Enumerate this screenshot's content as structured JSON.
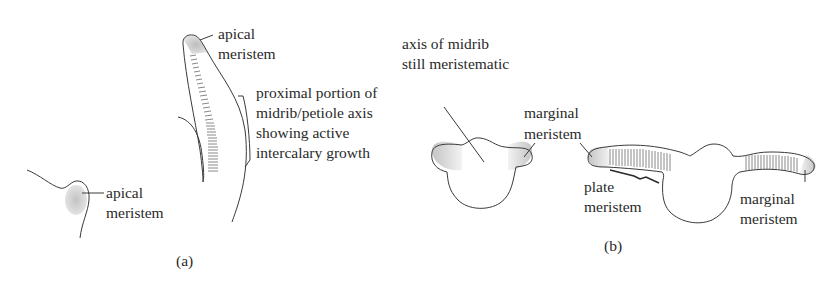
{
  "figure": {
    "panel_a": {
      "caption": "(a)",
      "labels": {
        "apical_meristem_tip": [
          "apical",
          "meristem"
        ],
        "proximal_portion": [
          "proximal portion of",
          "midrib/petiole axis",
          "showing active",
          "intercalary growth"
        ],
        "apical_meristem_small": [
          "apical",
          "meristem"
        ]
      }
    },
    "panel_b": {
      "caption": "(b)",
      "labels": {
        "axis_of_midrib": [
          "axis of midrib",
          "still meristematic"
        ],
        "marginal_meristem_left": [
          "marginal",
          "meristem"
        ],
        "plate_meristem": [
          "plate",
          "meristem"
        ],
        "marginal_meristem_right": [
          "marginal",
          "meristem"
        ]
      }
    },
    "colors": {
      "line": "#3a3a3a",
      "text": "#2a2a2a",
      "stipple": "#c8c8c8",
      "background": "#ffffff"
    }
  }
}
